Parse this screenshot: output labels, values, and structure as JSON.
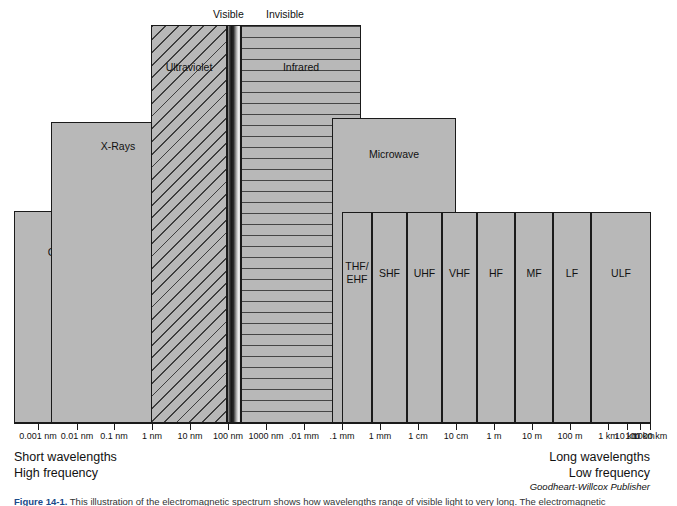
{
  "figure": {
    "title": "Electromagnetic Spectrum",
    "credit": "Goodheart-Willcox Publisher",
    "caption_prefix": "Figure 14-1.",
    "caption_text": " This illustration of the electromagnetic spectrum shows how wavelengths range of visible light to very long. The electromagnetic"
  },
  "top_labels": {
    "visible": "Visible",
    "invisible": "Invisible"
  },
  "notes": {
    "left": "Short wavelengths\nHigh frequency",
    "right": "Long wavelengths\nLow frequency"
  },
  "chart_data": {
    "type": "bar",
    "title": "Electromagnetic Spectrum",
    "xlabel": "Wavelength",
    "ylabel": "",
    "grid": false,
    "legend": "none",
    "axis_scale": "logarithmic",
    "tick_labels": [
      "0.001 nm",
      "0.01 nm",
      "0.1 nm",
      "1 nm",
      "10 nm",
      "100 nm",
      "1000 nm",
      ".01 mm",
      ".1 mm",
      "1 mm",
      "1 cm",
      "10 cm",
      "1 m",
      "10 m",
      "100 m",
      "1 km",
      "10 km",
      "100 km",
      "1000 km"
    ],
    "tick_x": [
      38,
      77,
      114,
      152,
      190,
      228,
      266,
      304,
      342,
      380,
      418,
      456,
      494,
      532,
      570,
      608,
      627,
      640,
      650
    ],
    "bands": [
      {
        "name": "Gamma Rays",
        "label": "Gamma\nRays",
        "fill": "solid",
        "x": 14,
        "y": 211,
        "w": 105,
        "h": 212,
        "label_y": 245
      },
      {
        "name": "X-Rays",
        "label": "X-Rays",
        "fill": "solid",
        "x": 51,
        "y": 122,
        "w": 134,
        "h": 301,
        "label_y": 139
      },
      {
        "name": "Ultraviolet",
        "label": "Ultraviolet",
        "fill": "diagonal-hatch",
        "x": 151,
        "y": 25,
        "w": 76,
        "h": 398,
        "label_y": 60
      },
      {
        "name": "Visible",
        "label": "",
        "fill": "visible-gradient",
        "x": 227,
        "y": 25,
        "w": 14,
        "h": 398,
        "label_y": 0
      },
      {
        "name": "Infrared",
        "label": "Infrared",
        "fill": "horizontal-hatch",
        "x": 241,
        "y": 25,
        "w": 120,
        "h": 398,
        "label_y": 60
      },
      {
        "name": "Microwave",
        "label": "Microwave",
        "fill": "solid",
        "x": 332,
        "y": 118,
        "w": 124,
        "h": 305,
        "label_y": 147
      },
      {
        "name": "THF/EHF",
        "label": "THF/\nEHF",
        "fill": "solid",
        "x": 342,
        "y": 212,
        "w": 30,
        "h": 211,
        "label_y": 259
      },
      {
        "name": "SHF",
        "label": "SHF",
        "fill": "solid",
        "x": 372,
        "y": 212,
        "w": 35,
        "h": 211,
        "label_y": 266
      },
      {
        "name": "UHF",
        "label": "UHF",
        "fill": "solid",
        "x": 407,
        "y": 212,
        "w": 35,
        "h": 211,
        "label_y": 266
      },
      {
        "name": "VHF",
        "label": "VHF",
        "fill": "solid",
        "x": 442,
        "y": 212,
        "w": 35,
        "h": 211,
        "label_y": 266
      },
      {
        "name": "HF",
        "label": "HF",
        "fill": "solid",
        "x": 477,
        "y": 212,
        "w": 38,
        "h": 211,
        "label_y": 266
      },
      {
        "name": "MF",
        "label": "MF",
        "fill": "solid",
        "x": 515,
        "y": 212,
        "w": 38,
        "h": 211,
        "label_y": 266
      },
      {
        "name": "LF",
        "label": "LF",
        "fill": "solid",
        "x": 553,
        "y": 212,
        "w": 38,
        "h": 211,
        "label_y": 266
      },
      {
        "name": "ULF",
        "label": "ULF",
        "fill": "solid",
        "x": 591,
        "y": 212,
        "w": 60,
        "h": 211,
        "label_y": 266
      }
    ],
    "region_markers": [
      {
        "label": "Visible",
        "x": 213,
        "y": 8
      },
      {
        "label": "Invisible",
        "x": 266,
        "y": 8
      }
    ]
  }
}
